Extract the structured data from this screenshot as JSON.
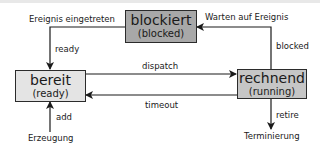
{
  "diagram": {
    "type": "state-diagram",
    "colors": {
      "blocked_fill": "#a8a8a8",
      "ready_fill": "#e4e4e4",
      "running_fill": "#c6c6c6",
      "line": "#1a1a1a"
    },
    "states": {
      "blocked": {
        "title": "blockiert",
        "subtitle": "(blocked)"
      },
      "ready": {
        "title": "bereit",
        "subtitle": "(ready)"
      },
      "running": {
        "title": "rechnend",
        "subtitle": "(running)"
      }
    },
    "edges": {
      "event_occurred": "Ereignis eingetreten",
      "ready": "ready",
      "wait_event": "Warten auf Ereignis",
      "blocked": "blocked",
      "dispatch": "dispatch",
      "timeout": "timeout",
      "add": "add",
      "creation": "Erzeugung",
      "retire": "retire",
      "termination": "Terminierung"
    }
  }
}
